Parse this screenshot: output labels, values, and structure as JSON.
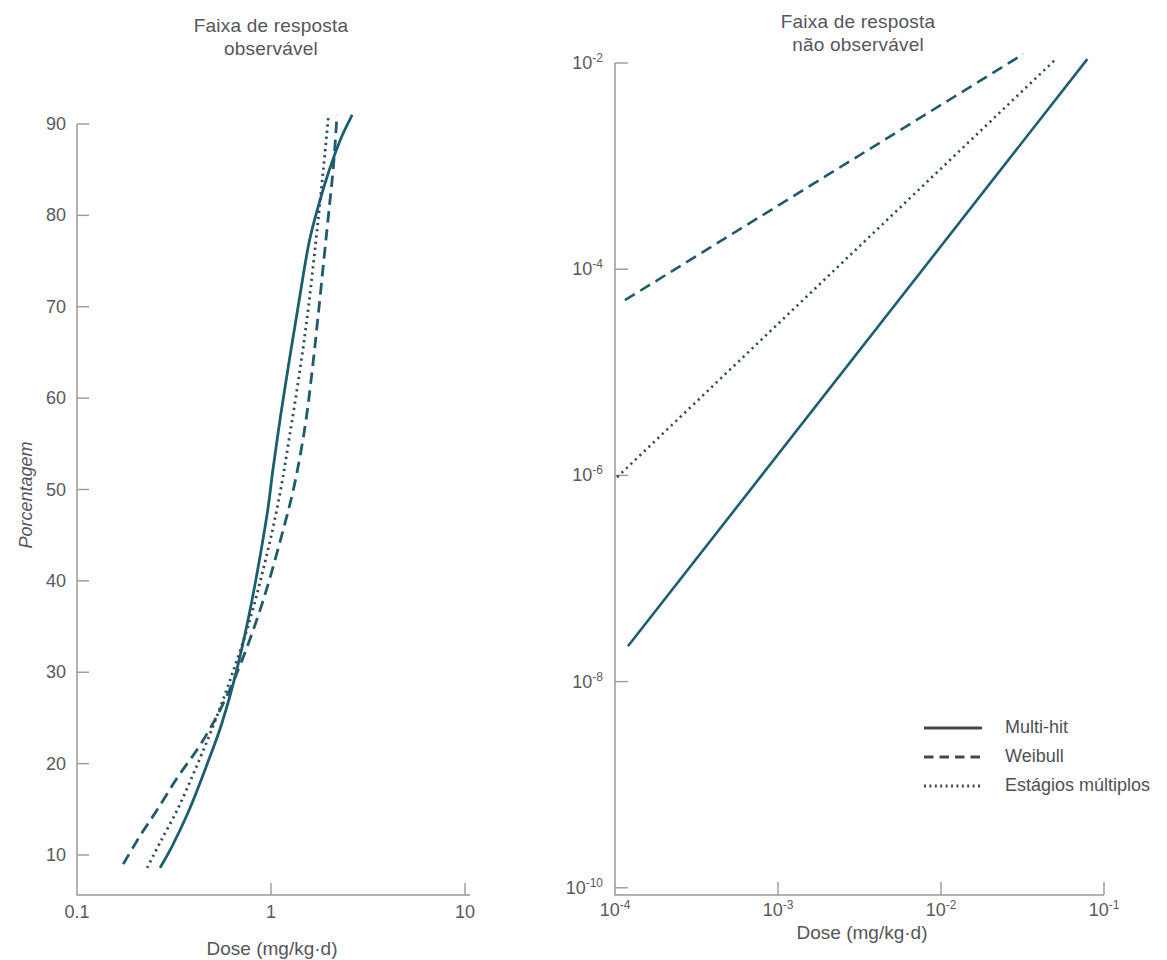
{
  "colors": {
    "background": "#ffffff",
    "axis": "#97999b",
    "tick_text": "#58595b",
    "title_text": "#545659",
    "line_solid": "#1b5e6f",
    "line_dashed": "#1f5b6b",
    "line_dotted": "#2f4d5c",
    "legend_line": "#47484c",
    "legend_text": "#4e5053"
  },
  "legend": {
    "items": [
      {
        "label": "Multi-hit",
        "style": "solid"
      },
      {
        "label": "Weibull",
        "style": "dashed"
      },
      {
        "label": "Estágios múltiplos",
        "style": "dotted"
      }
    ]
  },
  "chart_data": [
    {
      "id": "observable-range",
      "type": "line",
      "title": [
        "Faixa de resposta",
        "observável"
      ],
      "xlabel": "Dose (mg/kg·d)",
      "ylabel": "Porcentagem",
      "x_scale": "log",
      "y_scale": "linear",
      "xlim": [
        0.1,
        10
      ],
      "ylim": [
        10,
        90
      ],
      "xticks": [
        0.1,
        1,
        10
      ],
      "xtick_labels": [
        "0.1",
        "1",
        "10"
      ],
      "yticks": [
        10,
        20,
        30,
        40,
        50,
        60,
        70,
        80,
        90
      ],
      "grid": false,
      "series": [
        {
          "name": "Multi-hit",
          "style": "solid",
          "points": [
            [
              0.268,
              8.6
            ],
            [
              0.31,
              11
            ],
            [
              0.38,
              15
            ],
            [
              0.46,
              19.5
            ],
            [
              0.56,
              24.5
            ],
            [
              0.67,
              30.5
            ],
            [
              0.8,
              38
            ],
            [
              0.95,
              47
            ],
            [
              1.02,
              52
            ],
            [
              1.12,
              58
            ],
            [
              1.24,
              64
            ],
            [
              1.38,
              70
            ],
            [
              1.57,
              77
            ],
            [
              1.78,
              81.5
            ],
            [
              2.0,
              85
            ],
            [
              2.3,
              88.5
            ],
            [
              2.62,
              91
            ]
          ]
        },
        {
          "name": "Weibull",
          "style": "dashed",
          "points": [
            [
              0.173,
              9
            ],
            [
              0.21,
              12
            ],
            [
              0.26,
              15
            ],
            [
              0.33,
              18.5
            ],
            [
              0.43,
              22
            ],
            [
              0.55,
              26
            ],
            [
              0.7,
              31
            ],
            [
              0.9,
              37.5
            ],
            [
              1.12,
              44.5
            ],
            [
              1.32,
              50.5
            ],
            [
              1.5,
              57
            ],
            [
              1.63,
              63
            ],
            [
              1.75,
              69
            ],
            [
              1.88,
              75.5
            ],
            [
              2.0,
              81
            ],
            [
              2.1,
              85.5
            ],
            [
              2.19,
              91
            ]
          ]
        },
        {
          "name": "Estágios múltiplos",
          "style": "dotted",
          "points": [
            [
              0.23,
              8.6
            ],
            [
              0.27,
              11.5
            ],
            [
              0.33,
              15
            ],
            [
              0.4,
              19
            ],
            [
              0.49,
              23.5
            ],
            [
              0.6,
              28.5
            ],
            [
              0.76,
              35
            ],
            [
              0.93,
              42
            ],
            [
              1.1,
              49
            ],
            [
              1.25,
              56
            ],
            [
              1.42,
              63.5
            ],
            [
              1.56,
              70
            ],
            [
              1.7,
              77
            ],
            [
              1.82,
              83
            ],
            [
              1.92,
              88
            ],
            [
              1.98,
              91
            ]
          ]
        }
      ]
    },
    {
      "id": "non-observable-range",
      "type": "line",
      "title": [
        "Faixa de resposta",
        "não observável"
      ],
      "xlabel": "Dose (mg/kg·d)",
      "ylabel": "",
      "x_scale": "log",
      "y_scale": "log",
      "xlim": [
        0.0001,
        0.1
      ],
      "ylim": [
        1e-10,
        0.01
      ],
      "xtick_exponents": [
        -4,
        -3,
        -2,
        -1
      ],
      "ytick_exponents": [
        -2,
        -4,
        -6,
        -8,
        -10
      ],
      "grid": false,
      "series": [
        {
          "name": "Multi-hit",
          "style": "solid",
          "slope_loglog": 2,
          "points": [
            [
              0.00012,
              2.2e-08
            ],
            [
              0.079,
              0.0109
            ]
          ]
        },
        {
          "name": "Weibull",
          "style": "dashed",
          "slope_loglog": 1,
          "points": [
            [
              0.000115,
              5e-05
            ],
            [
              0.032,
              0.0122
            ]
          ]
        },
        {
          "name": "Estágios múltiplos",
          "style": "dotted",
          "slope_loglog": 1.5,
          "points": [
            [
              0.000103,
              9.6e-07
            ],
            [
              0.05,
              0.0107
            ]
          ]
        }
      ]
    }
  ]
}
